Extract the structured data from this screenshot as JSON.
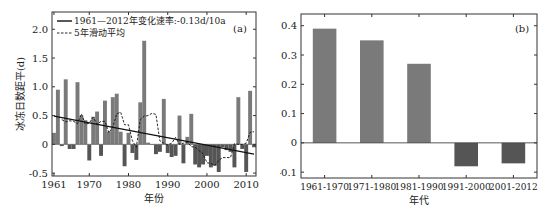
{
  "chart_data": [
    {
      "type": "bar",
      "panel_label": "(a)",
      "xlabel": "年份",
      "ylabel": "冰冻日数距平(d)",
      "ylim": [
        -0.55,
        2.3
      ],
      "yticks": [
        -0.5,
        0,
        0.5,
        1.0,
        1.5,
        2.0
      ],
      "ytick_labels": [
        "-0.5",
        "0",
        "0.5",
        "1.0",
        "1.5",
        "2.0"
      ],
      "xlim": [
        1960.5,
        2012.5
      ],
      "xticks": [
        1961,
        1970,
        1980,
        1990,
        2000,
        2010
      ],
      "xtick_labels": [
        "1961",
        "1970",
        "1980",
        "1990",
        "2000",
        "2010"
      ],
      "legend": [
        {
          "style": "solid",
          "label": "1961—2012年变化速率:-0.13d/10a"
        },
        {
          "style": "dashed",
          "label": "5年滑动平均"
        }
      ],
      "x": [
        1961,
        1962,
        1963,
        1964,
        1965,
        1966,
        1967,
        1968,
        1969,
        1970,
        1971,
        1972,
        1973,
        1974,
        1975,
        1976,
        1977,
        1978,
        1979,
        1980,
        1981,
        1982,
        1983,
        1984,
        1985,
        1986,
        1987,
        1988,
        1989,
        1990,
        1991,
        1992,
        1993,
        1994,
        1995,
        1996,
        1997,
        1998,
        1999,
        2000,
        2001,
        2002,
        2003,
        2004,
        2005,
        2006,
        2007,
        2008,
        2009,
        2010,
        2011,
        2012
      ],
      "values": [
        0.2,
        0.95,
        -0.03,
        1.13,
        -0.08,
        -0.08,
        1.08,
        0.5,
        0.42,
        -0.28,
        0.48,
        0.57,
        -0.2,
        0.76,
        0.22,
        0.82,
        0.88,
        0.22,
        -0.38,
        0.2,
        -0.15,
        -0.27,
        0.73,
        1.8,
        0.03,
        0.0,
        -0.17,
        -0.13,
        0.79,
        -0.15,
        -0.22,
        -0.2,
        0.5,
        -0.33,
        0.13,
        0.53,
        -0.35,
        -0.4,
        -0.35,
        -0.2,
        -0.4,
        -0.37,
        -0.48,
        -0.05,
        -0.1,
        -0.13,
        -0.4,
        0.82,
        -0.08,
        -0.48,
        0.93,
        -0.05
      ],
      "trend": {
        "slope_per_decade": -0.13,
        "start": [
          1961,
          0.49
        ],
        "end": [
          2012,
          -0.17
        ]
      },
      "moving_average_5yr": [
        [
          1963,
          0.43
        ],
        [
          1964,
          0.39
        ],
        [
          1965,
          0.41
        ],
        [
          1966,
          0.4
        ],
        [
          1967,
          0.36
        ],
        [
          1968,
          0.53
        ],
        [
          1969,
          0.35
        ],
        [
          1970,
          0.37
        ],
        [
          1971,
          0.47
        ],
        [
          1972,
          0.35
        ],
        [
          1973,
          0.4
        ],
        [
          1974,
          0.4
        ],
        [
          1975,
          0.2
        ],
        [
          1976,
          0.3
        ],
        [
          1977,
          0.53
        ],
        [
          1978,
          0.56
        ],
        [
          1979,
          0.34
        ],
        [
          1980,
          0.34
        ],
        [
          1981,
          0.06
        ],
        [
          1982,
          -0.05
        ],
        [
          1983,
          0.43
        ],
        [
          1984,
          0.49
        ],
        [
          1985,
          0.5
        ],
        [
          1986,
          0.54
        ],
        [
          1987,
          0.52
        ],
        [
          1988,
          0.06
        ],
        [
          1989,
          0.02
        ],
        [
          1990,
          -0.01
        ],
        [
          1991,
          0.02
        ],
        [
          1992,
          0.12
        ],
        [
          1993,
          0.0
        ],
        [
          1994,
          0.02
        ],
        [
          1995,
          0.04
        ],
        [
          1996,
          -0.04
        ],
        [
          1997,
          -0.05
        ],
        [
          1998,
          -0.11
        ],
        [
          1999,
          -0.16
        ],
        [
          2000,
          -0.32
        ],
        [
          2001,
          -0.33
        ],
        [
          2002,
          -0.37
        ],
        [
          2003,
          -0.28
        ],
        [
          2004,
          -0.23
        ],
        [
          2005,
          -0.23
        ],
        [
          2006,
          -0.23
        ],
        [
          2007,
          0.01
        ],
        [
          2008,
          0.0
        ],
        [
          2009,
          0.0
        ],
        [
          2010,
          0.02
        ],
        [
          2011,
          0.21
        ],
        [
          2012,
          0.22
        ]
      ]
    },
    {
      "type": "bar",
      "panel_label": "(b)",
      "xlabel": "年代",
      "ylabel": "冰冻日数距平(d)",
      "ylim": [
        -0.12,
        0.44
      ],
      "yticks": [
        -0.1,
        0,
        0.1,
        0.2,
        0.3,
        0.4
      ],
      "ytick_labels": [
        "-0.1",
        "0",
        "0.1",
        "0.2",
        "0.3",
        "0.4"
      ],
      "categories": [
        "1961-1970",
        "1971-1980",
        "1981-1990",
        "1991-2000",
        "2001-2012"
      ],
      "values": [
        0.39,
        0.35,
        0.27,
        -0.08,
        -0.07
      ]
    }
  ],
  "colors": {
    "bar_positive": "#7a7a7a",
    "bar_negative": "#555555",
    "line": "#111111",
    "axis": "#333333"
  }
}
